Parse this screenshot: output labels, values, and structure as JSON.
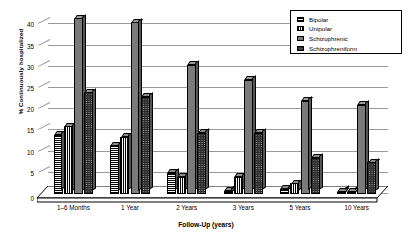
{
  "chart_data": {
    "type": "bar",
    "title": "",
    "xlabel": "Follow-Up (years)",
    "ylabel": "% Continuously hospitalized",
    "categories": [
      "1–6 Months",
      "1 Year",
      "2 Years",
      "3 Years",
      "5 Years",
      "10 Years"
    ],
    "series": [
      {
        "name": "Bipolar",
        "values": [
          14.0,
          11.5,
          5.0,
          0.7,
          1.2,
          0.5
        ]
      },
      {
        "name": "Unipolar",
        "values": [
          16.0,
          13.5,
          4.0,
          4.0,
          2.5,
          0.5
        ]
      },
      {
        "name": "Schizophrenic",
        "values": [
          41.5,
          40.5,
          30.5,
          27.0,
          22.0,
          21.0
        ]
      },
      {
        "name": "Schizophreniform",
        "values": [
          24.0,
          23.0,
          14.5,
          14.5,
          8.5,
          7.5
        ]
      }
    ],
    "ylim": [
      0,
      42
    ],
    "yticks": [
      0,
      5,
      10,
      15,
      20,
      25,
      30,
      35,
      40
    ],
    "grid": true,
    "legend_position": "top-right",
    "legend": [
      "Bipolar",
      "Unipolar",
      "Schizophrenic",
      "Schizophreniform"
    ],
    "patterns": [
      "horizontal-hatch",
      "vertical-hatch",
      "solid-gray",
      "checkerboard"
    ]
  }
}
